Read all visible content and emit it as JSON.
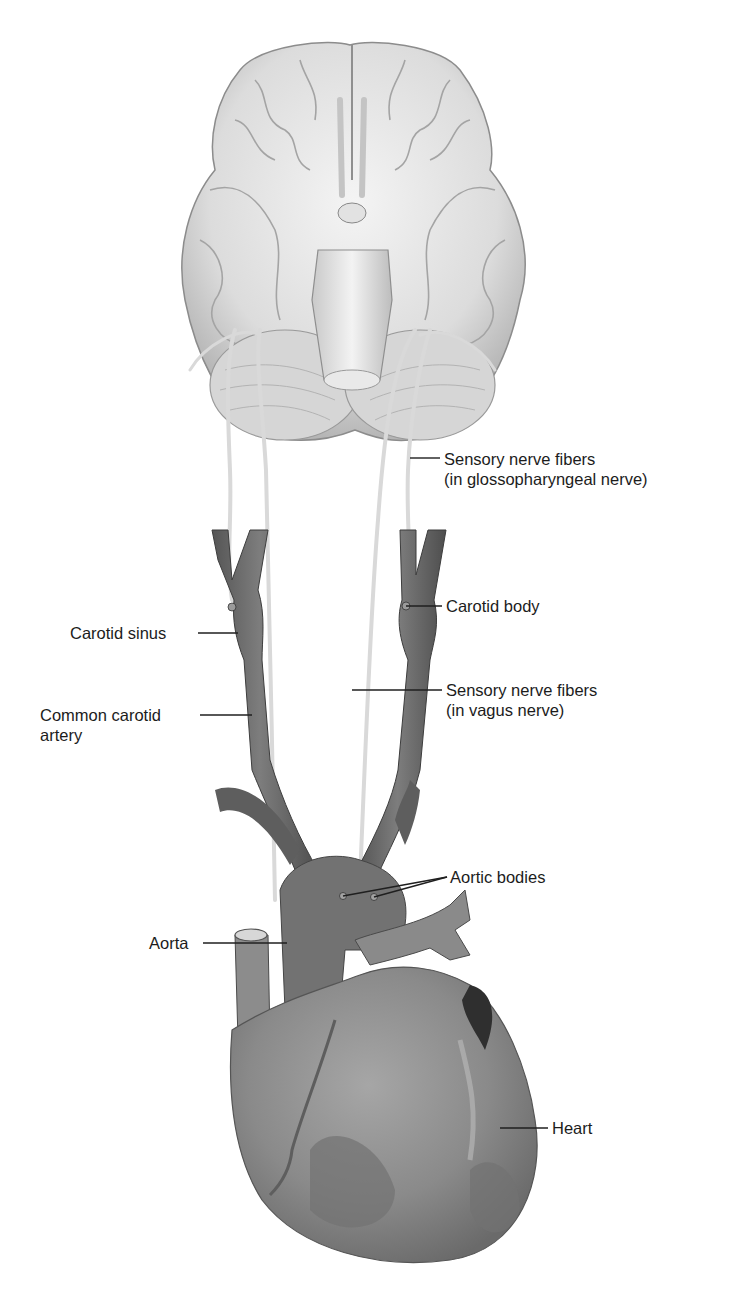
{
  "figure": {
    "structures": [
      "brain (inferior view)",
      "carotid arteries",
      "aortic arch",
      "heart"
    ]
  },
  "labels": {
    "glossopharyngeal": {
      "line1": "Sensory nerve fibers",
      "line2": "(in glossopharyngeal nerve)"
    },
    "carotid_body": "Carotid body",
    "carotid_sinus": "Carotid sinus",
    "vagus": {
      "line1": "Sensory nerve fibers",
      "line2": "(in vagus nerve)"
    },
    "common_carotid": {
      "line1": "Common carotid",
      "line2": "artery"
    },
    "aortic_bodies": "Aortic bodies",
    "aorta": "Aorta",
    "heart": "Heart"
  },
  "colors": {
    "background": "#ffffff",
    "brain_fill": "#e6e6e6",
    "brain_shade": "#b8b8b8",
    "vessel_fill": "#6f6f6f",
    "vessel_dark": "#4a4a4a",
    "heart_fill": "#8a8a8a",
    "nerve": "#ededed",
    "text": "#1c1c1c"
  }
}
